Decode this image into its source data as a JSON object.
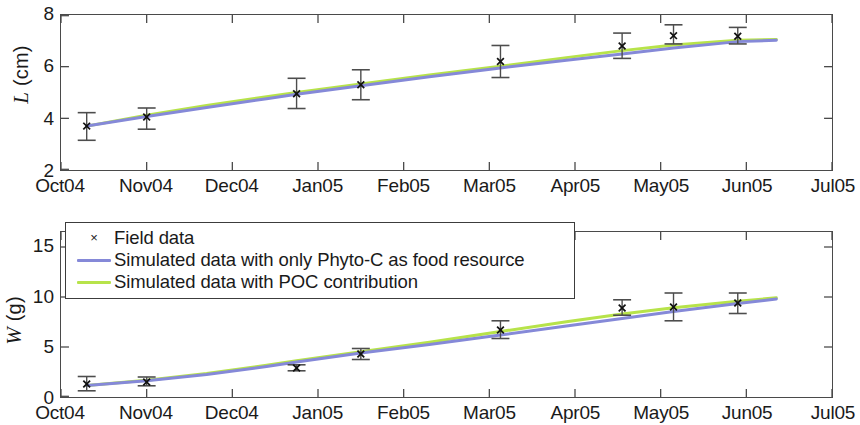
{
  "figure": {
    "background": "#ffffff",
    "axis_color": "#4a4a4a"
  },
  "legend": {
    "position": "upper-left-of-bottom-panel",
    "entries": [
      {
        "label": "Field data",
        "marker": "x-marker",
        "symbol": "×",
        "color": "#222222"
      },
      {
        "label": "Simulated data with only Phyto-C as food resource",
        "marker": "line",
        "color": "#8589d8"
      },
      {
        "label": "Simulated data with POC contribution",
        "marker": "line",
        "color": "#b7e34a"
      }
    ]
  },
  "chart_data": [
    {
      "type": "line",
      "id": "panel-L",
      "title": "",
      "xlabel": "",
      "ylabel": "L (cm)",
      "ylabel_symbol": "L",
      "ylabel_unit": "(cm)",
      "grid": false,
      "x": [
        "Oct04",
        "Nov04",
        "Dec04",
        "Jan05",
        "Feb05",
        "Mar05",
        "Apr05",
        "May05",
        "Jun05",
        "Jul05"
      ],
      "xticklabels": [
        "Oct04",
        "Nov04",
        "Dec04",
        "Jan05",
        "Feb05",
        "Mar05",
        "Apr05",
        "May05",
        "Jun05",
        "Jul05"
      ],
      "yticklabels": [
        "2",
        "4",
        "6",
        "8"
      ],
      "yticks": [
        2,
        4,
        6,
        8
      ],
      "ylim": [
        2,
        8
      ],
      "xlim": [
        0,
        9
      ],
      "series": [
        {
          "name": "Field data",
          "type": "errorbar",
          "color": "#222222",
          "points": [
            {
              "x": 0.3,
              "y": 3.7,
              "yerr_low": 3.15,
              "yerr_high": 4.22
            },
            {
              "x": 1.0,
              "y": 4.05,
              "yerr_low": 3.58,
              "yerr_high": 4.4
            },
            {
              "x": 2.75,
              "y": 4.95,
              "yerr_low": 4.38,
              "yerr_high": 5.55
            },
            {
              "x": 3.5,
              "y": 5.3,
              "yerr_low": 4.72,
              "yerr_high": 5.88
            },
            {
              "x": 5.13,
              "y": 6.2,
              "yerr_low": 5.58,
              "yerr_high": 6.82
            },
            {
              "x": 6.55,
              "y": 6.8,
              "yerr_low": 6.32,
              "yerr_high": 7.3
            },
            {
              "x": 7.15,
              "y": 7.2,
              "yerr_low": 6.88,
              "yerr_high": 7.62
            },
            {
              "x": 7.9,
              "y": 7.18,
              "yerr_low": 6.88,
              "yerr_high": 7.52
            }
          ]
        },
        {
          "name": "Simulated data with only Phyto-C as food resource",
          "type": "line",
          "color": "#8589d8",
          "values": [
            {
              "x": 0.3,
              "y": 3.7
            },
            {
              "x": 1.0,
              "y": 4.07
            },
            {
              "x": 1.7,
              "y": 4.42
            },
            {
              "x": 2.4,
              "y": 4.76
            },
            {
              "x": 2.75,
              "y": 4.93
            },
            {
              "x": 3.5,
              "y": 5.26
            },
            {
              "x": 4.3,
              "y": 5.61
            },
            {
              "x": 5.13,
              "y": 5.95
            },
            {
              "x": 5.9,
              "y": 6.25
            },
            {
              "x": 6.55,
              "y": 6.49
            },
            {
              "x": 7.15,
              "y": 6.72
            },
            {
              "x": 7.9,
              "y": 6.97
            },
            {
              "x": 8.35,
              "y": 7.02
            }
          ]
        },
        {
          "name": "Simulated data with POC contribution",
          "type": "line",
          "color": "#b7e34a",
          "values": [
            {
              "x": 0.3,
              "y": 3.7
            },
            {
              "x": 1.0,
              "y": 4.12
            },
            {
              "x": 1.7,
              "y": 4.5
            },
            {
              "x": 2.4,
              "y": 4.84
            },
            {
              "x": 2.75,
              "y": 5.0
            },
            {
              "x": 3.5,
              "y": 5.33
            },
            {
              "x": 4.3,
              "y": 5.68
            },
            {
              "x": 5.13,
              "y": 6.02
            },
            {
              "x": 5.9,
              "y": 6.35
            },
            {
              "x": 6.55,
              "y": 6.62
            },
            {
              "x": 7.15,
              "y": 6.84
            },
            {
              "x": 7.9,
              "y": 7.02
            },
            {
              "x": 8.35,
              "y": 7.05
            }
          ]
        }
      ]
    },
    {
      "type": "line",
      "id": "panel-W",
      "title": "",
      "xlabel": "",
      "ylabel": "W (g)",
      "ylabel_symbol": "W",
      "ylabel_unit": "(g)",
      "grid": false,
      "x": [
        "Oct04",
        "Nov04",
        "Dec04",
        "Jan05",
        "Feb05",
        "Mar05",
        "Apr05",
        "May05",
        "Jun05",
        "Jul05"
      ],
      "xticklabels": [
        "Oct04",
        "Nov04",
        "Dec04",
        "Jan05",
        "Feb05",
        "Mar05",
        "Apr05",
        "May05",
        "Jun05",
        "Jul05"
      ],
      "yticklabels": [
        "0",
        "5",
        "10",
        "15"
      ],
      "yticks": [
        0,
        5,
        10,
        15
      ],
      "ylim": [
        0,
        16.5
      ],
      "xlim": [
        0,
        9
      ],
      "series": [
        {
          "name": "Field data",
          "type": "errorbar",
          "color": "#222222",
          "points": [
            {
              "x": 0.3,
              "y": 1.3,
              "yerr_low": 0.62,
              "yerr_high": 2.05
            },
            {
              "x": 1.0,
              "y": 1.5,
              "yerr_low": 1.12,
              "yerr_high": 2.0
            },
            {
              "x": 2.75,
              "y": 2.9,
              "yerr_low": 2.62,
              "yerr_high": 3.22
            },
            {
              "x": 3.5,
              "y": 4.3,
              "yerr_low": 3.75,
              "yerr_high": 4.85
            },
            {
              "x": 5.13,
              "y": 6.7,
              "yerr_low": 5.85,
              "yerr_high": 7.62
            },
            {
              "x": 6.55,
              "y": 8.9,
              "yerr_low": 8.18,
              "yerr_high": 9.72
            },
            {
              "x": 7.15,
              "y": 9.0,
              "yerr_low": 7.62,
              "yerr_high": 10.4
            },
            {
              "x": 7.9,
              "y": 9.4,
              "yerr_low": 8.35,
              "yerr_high": 10.4
            }
          ]
        },
        {
          "name": "Simulated data with only Phyto-C as food resource",
          "type": "line",
          "color": "#8589d8",
          "values": [
            {
              "x": 0.3,
              "y": 1.15
            },
            {
              "x": 1.0,
              "y": 1.62
            },
            {
              "x": 1.7,
              "y": 2.25
            },
            {
              "x": 2.4,
              "y": 3.05
            },
            {
              "x": 2.75,
              "y": 3.5
            },
            {
              "x": 3.5,
              "y": 4.4
            },
            {
              "x": 4.3,
              "y": 5.25
            },
            {
              "x": 5.13,
              "y": 6.2
            },
            {
              "x": 5.9,
              "y": 7.1
            },
            {
              "x": 6.55,
              "y": 7.85
            },
            {
              "x": 7.15,
              "y": 8.55
            },
            {
              "x": 7.9,
              "y": 9.35
            },
            {
              "x": 8.35,
              "y": 9.8
            }
          ]
        },
        {
          "name": "Simulated data with POC contribution",
          "type": "line",
          "color": "#b7e34a",
          "values": [
            {
              "x": 0.3,
              "y": 1.15
            },
            {
              "x": 1.0,
              "y": 1.68
            },
            {
              "x": 1.7,
              "y": 2.35
            },
            {
              "x": 2.4,
              "y": 3.18
            },
            {
              "x": 2.75,
              "y": 3.62
            },
            {
              "x": 3.5,
              "y": 4.52
            },
            {
              "x": 4.3,
              "y": 5.48
            },
            {
              "x": 5.13,
              "y": 6.55
            },
            {
              "x": 5.9,
              "y": 7.52
            },
            {
              "x": 6.55,
              "y": 8.3
            },
            {
              "x": 7.15,
              "y": 8.92
            },
            {
              "x": 7.9,
              "y": 9.58
            },
            {
              "x": 8.35,
              "y": 9.92
            }
          ]
        }
      ]
    }
  ]
}
